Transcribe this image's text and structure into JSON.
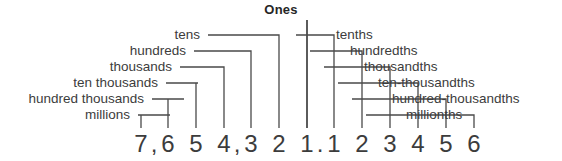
{
  "diagram": {
    "title": "Ones",
    "kind": "place-value-chart",
    "line_color": "#4a4a4a",
    "text_color": "#3c3c3c",
    "title_color": "#262626",
    "background": "#ffffff"
  },
  "numerals": [
    {
      "glyph": "7",
      "x": 141,
      "role": "millions-digit"
    },
    {
      "glyph": ",",
      "x": 154,
      "role": "comma-millions"
    },
    {
      "glyph": "6",
      "x": 168,
      "role": "hundred-thousands-digit"
    },
    {
      "glyph": "5",
      "x": 196,
      "role": "ten-thousands-digit"
    },
    {
      "glyph": "4",
      "x": 224,
      "role": "thousands-digit"
    },
    {
      "glyph": ",",
      "x": 237,
      "role": "comma-thousands"
    },
    {
      "glyph": "3",
      "x": 251,
      "role": "hundreds-digit"
    },
    {
      "glyph": "2",
      "x": 279,
      "role": "tens-digit"
    },
    {
      "glyph": "1",
      "x": 307,
      "role": "ones-digit"
    },
    {
      "glyph": ".",
      "x": 320,
      "role": "decimal-point"
    },
    {
      "glyph": "1",
      "x": 334,
      "role": "tenths-digit"
    },
    {
      "glyph": "2",
      "x": 362,
      "role": "hundredths-digit"
    },
    {
      "glyph": "3",
      "x": 390,
      "role": "thousandths-digit"
    },
    {
      "glyph": "4",
      "x": 418,
      "role": "ten-thousandths-digit"
    },
    {
      "glyph": "5",
      "x": 446,
      "role": "hundred-thousandths-digit"
    },
    {
      "glyph": "6",
      "x": 474,
      "role": "millionths-digit"
    }
  ],
  "ones_column": {
    "label": "Ones",
    "digit_x": 307,
    "line_top": 20,
    "line_bottom": 128
  },
  "left_labels": [
    {
      "text": "tens",
      "text_right": 200,
      "y": 28,
      "elbow_x": 250,
      "digit_x": 279,
      "row": 1
    },
    {
      "text": "hundreds",
      "text_right": 186,
      "y": 44,
      "elbow_x": 236,
      "digit_x": 251,
      "row": 2
    },
    {
      "text": "thousands",
      "text_right": 172,
      "y": 60,
      "elbow_x": 222,
      "digit_x": 224,
      "row": 3
    },
    {
      "text": "ten thousands",
      "text_right": 158,
      "y": 76,
      "elbow_x": 208,
      "digit_x": 196,
      "row": 4
    },
    {
      "text": "hundred thousands",
      "text_right": 144,
      "y": 92,
      "elbow_x": 194,
      "digit_x": 168,
      "row": 5
    },
    {
      "text": "millions",
      "text_right": 130,
      "y": 108,
      "elbow_x": 180,
      "digit_x": 141,
      "row": 6
    }
  ],
  "right_labels": [
    {
      "text": "tenths",
      "text_left": 336,
      "y": 28,
      "elbow_x": 296,
      "digit_x": 334,
      "row": 1
    },
    {
      "text": "hundredths",
      "text_left": 350,
      "y": 44,
      "elbow_x": 318,
      "digit_x": 362,
      "row": 2
    },
    {
      "text": "thousandths",
      "text_left": 364,
      "y": 60,
      "elbow_x": 340,
      "digit_x": 390,
      "row": 3
    },
    {
      "text": "ten-thousandths",
      "text_left": 378,
      "y": 76,
      "elbow_x": 362,
      "digit_x": 418,
      "row": 4
    },
    {
      "text": "hundred-thousandths",
      "text_left": 392,
      "y": 92,
      "elbow_x": 384,
      "digit_x": 446,
      "row": 5
    },
    {
      "text": "millionths",
      "text_left": 406,
      "y": 108,
      "elbow_x": 406,
      "digit_x": 474,
      "row": 6
    }
  ]
}
